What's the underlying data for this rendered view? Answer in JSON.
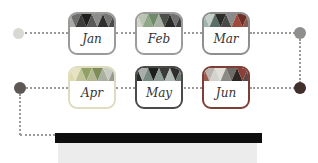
{
  "diagram": {
    "months": [
      {
        "label": "Jan",
        "border": "#9a9a98",
        "header_palette": [
          "#a9a9a6",
          "#6e6e6c",
          "#3c3c3a",
          "#1f1f1e",
          "#585856",
          "#8c8c8a",
          "#2e2e2c",
          "#767674",
          "#4a4a48"
        ]
      },
      {
        "label": "Feb",
        "border": "#9c9c9a",
        "header_palette": [
          "#d2d5cc",
          "#b9c4b2",
          "#8fa888",
          "#6f8a68",
          "#a8b2a2",
          "#4e4e4c",
          "#2a2a28",
          "#707070",
          "#3c3c3a"
        ]
      },
      {
        "label": "Mar",
        "border": "#8e8e8c",
        "header_palette": [
          "#9eb5ae",
          "#c3cfc7",
          "#5c6e68",
          "#2c2c2a",
          "#4a4a48",
          "#8a8a88",
          "#a04a3c",
          "#6e2f28",
          "#8a5a52"
        ]
      },
      {
        "label": "Apr",
        "border": "#e0dcc2",
        "header_palette": [
          "#ded9ab",
          "#e6e2c2",
          "#c2c49a",
          "#93a065",
          "#b4b993",
          "#7e8c58",
          "#aab0a2",
          "#c8cbc2",
          "#969a90"
        ]
      },
      {
        "label": "May",
        "border": "#4a4a48",
        "header_palette": [
          "#2a2a28",
          "#a8aeaa",
          "#788a82",
          "#1e1e1c",
          "#909c96",
          "#3a3a38",
          "#b4bab6",
          "#2e2e2c",
          "#6e7a74"
        ]
      },
      {
        "label": "Jun",
        "border": "#7e3e36",
        "header_palette": [
          "#9b5a50",
          "#b9b4ae",
          "#d4d2cc",
          "#e2ded8",
          "#8c8a84",
          "#6e6a66",
          "#2e2624",
          "#8a4038",
          "#5a4a46"
        ]
      }
    ],
    "connectors": {
      "line_color": "#9a9a9a",
      "dots": [
        {
          "name": "row1-start",
          "color": "#d9d9d4"
        },
        {
          "name": "row1-end",
          "color": "#8f8f8d"
        },
        {
          "name": "row2-start",
          "color": "#5e5854"
        },
        {
          "name": "row2-end",
          "color": "#402f2b"
        }
      ]
    },
    "footer": {
      "bar_color": "#0e0e0e",
      "panel_color": "#ececec"
    }
  }
}
